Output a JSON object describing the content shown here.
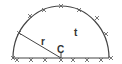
{
  "diagram": {
    "type": "semicircle",
    "labels": {
      "radius": "r",
      "center": "C",
      "region": "t"
    },
    "colors": {
      "stroke": "#444444",
      "text": "#333333",
      "background": "#ffffff"
    },
    "marks": {
      "arc_count": 8,
      "baseline_count": 8,
      "glyph": "x"
    }
  }
}
